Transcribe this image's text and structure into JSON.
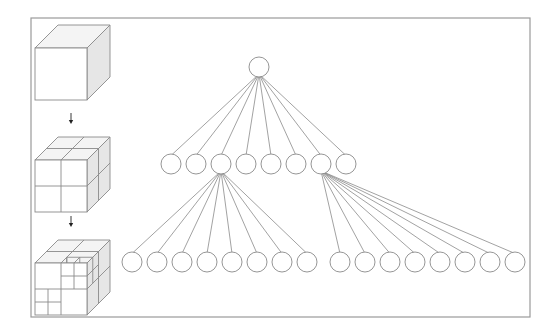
{
  "figure": {
    "frame": {
      "x": 31,
      "y": 18,
      "w": 499,
      "h": 299,
      "stroke": "#9a9a9a"
    },
    "colors": {
      "line": "#8a8a8a",
      "node_fill": "#ffffff",
      "face_front": "#ffffff",
      "face_top": "#f4f4f4",
      "face_side": "#e6e6e6",
      "arrow": "#222222"
    }
  },
  "cubes": [
    {
      "label": "level-0",
      "subdivision": "none",
      "x": 35,
      "y": 25
    },
    {
      "label": "level-1",
      "subdivision": "2x2x2",
      "x": 35,
      "y": 137
    },
    {
      "label": "level-2",
      "subdivision": "partial",
      "x": 35,
      "y": 240
    }
  ],
  "arrows": [
    {
      "x": 71,
      "y1": 113,
      "y2": 124
    },
    {
      "x": 71,
      "y1": 216,
      "y2": 227
    }
  ],
  "tree": {
    "node_radius": 10,
    "root": {
      "x": 259,
      "y": 67
    },
    "level1": [
      {
        "x": 171,
        "y": 164
      },
      {
        "x": 196,
        "y": 164
      },
      {
        "x": 221,
        "y": 164
      },
      {
        "x": 246,
        "y": 164
      },
      {
        "x": 271,
        "y": 164
      },
      {
        "x": 296,
        "y": 164
      },
      {
        "x": 321,
        "y": 164
      },
      {
        "x": 346,
        "y": 164
      }
    ],
    "level2_groups": [
      {
        "parent_index": 2,
        "children": [
          {
            "x": 132,
            "y": 262
          },
          {
            "x": 157,
            "y": 262
          },
          {
            "x": 182,
            "y": 262
          },
          {
            "x": 207,
            "y": 262
          },
          {
            "x": 232,
            "y": 262
          },
          {
            "x": 257,
            "y": 262
          },
          {
            "x": 282,
            "y": 262
          },
          {
            "x": 307,
            "y": 262
          }
        ]
      },
      {
        "parent_index": 6,
        "children": [
          {
            "x": 340,
            "y": 262
          },
          {
            "x": 365,
            "y": 262
          },
          {
            "x": 390,
            "y": 262
          },
          {
            "x": 415,
            "y": 262
          },
          {
            "x": 440,
            "y": 262
          },
          {
            "x": 465,
            "y": 262
          },
          {
            "x": 490,
            "y": 262
          },
          {
            "x": 515,
            "y": 262
          }
        ]
      }
    ]
  }
}
